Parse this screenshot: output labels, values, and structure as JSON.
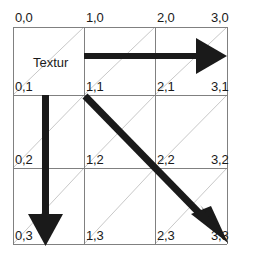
{
  "figure": {
    "caption_text": "Textur",
    "colors": {
      "grid_line": "#808080",
      "diagonal_line": "#c8c8c8",
      "arrow": "#1a1a1a",
      "text": "#1a1a1a",
      "background": "#ffffff"
    },
    "grid": {
      "columns": 3,
      "rows": 3,
      "x_positions": [
        13,
        84,
        155,
        227
      ],
      "y_positions": [
        27,
        95,
        168,
        244
      ]
    },
    "coordinate_labels": [
      {
        "text": "0,0",
        "col": 0,
        "row": 0,
        "x": 15,
        "y": 11
      },
      {
        "text": "1,0",
        "col": 1,
        "row": 0,
        "x": 86,
        "y": 11
      },
      {
        "text": "2,0",
        "col": 2,
        "row": 0,
        "x": 157,
        "y": 11
      },
      {
        "text": "3,0",
        "col": 3,
        "row": 0,
        "x": 211,
        "y": 11
      },
      {
        "text": "0,1",
        "col": 0,
        "row": 1,
        "x": 15,
        "y": 80
      },
      {
        "text": "1,1",
        "col": 1,
        "row": 1,
        "x": 86,
        "y": 80
      },
      {
        "text": "2,1",
        "col": 2,
        "row": 1,
        "x": 157,
        "y": 80
      },
      {
        "text": "3,1",
        "col": 3,
        "row": 1,
        "x": 211,
        "y": 80
      },
      {
        "text": "0,2",
        "col": 0,
        "row": 2,
        "x": 15,
        "y": 153
      },
      {
        "text": "1,2",
        "col": 1,
        "row": 2,
        "x": 86,
        "y": 153
      },
      {
        "text": "2,2",
        "col": 2,
        "row": 2,
        "x": 157,
        "y": 153
      },
      {
        "text": "3,2",
        "col": 3,
        "row": 2,
        "x": 211,
        "y": 153
      },
      {
        "text": "0,3",
        "col": 0,
        "row": 3,
        "x": 15,
        "y": 229
      },
      {
        "text": "1,3",
        "col": 1,
        "row": 3,
        "x": 86,
        "y": 229
      },
      {
        "text": "2,3",
        "col": 2,
        "row": 3,
        "x": 157,
        "y": 229
      },
      {
        "text": "3,3",
        "col": 3,
        "row": 3,
        "x": 211,
        "y": 229
      }
    ],
    "textur": {
      "text": "Textur",
      "x": 33,
      "y": 56
    },
    "arrows": [
      {
        "name": "horizontal-arrow",
        "from": "1,0",
        "to": "3,0",
        "direction": "right"
      },
      {
        "name": "vertical-arrow",
        "from": "0,1",
        "to": "0,3",
        "direction": "down"
      },
      {
        "name": "diagonal-arrow",
        "from": "1,1",
        "to": "3,3",
        "direction": "down-right"
      }
    ]
  }
}
